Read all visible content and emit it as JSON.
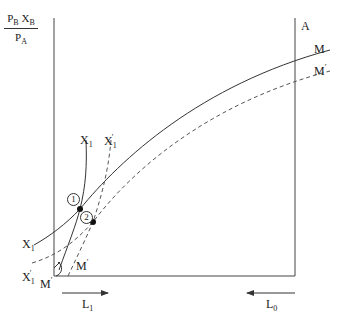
{
  "diagram": {
    "y_axis_label": {
      "numerator": [
        "P",
        "B",
        "X",
        "B"
      ],
      "denominator": [
        "P",
        "A"
      ]
    },
    "right_axis_label": "A",
    "curves": {
      "M": {
        "label": "M",
        "style": "solid"
      },
      "M_prime": {
        "label": "M",
        "prime": "′",
        "style": "dashed"
      },
      "X1": {
        "label": "X",
        "sub": "1",
        "style": "solid"
      },
      "X1_prime": {
        "label": "X",
        "sub": "1",
        "prime": "′",
        "style": "dashed"
      }
    },
    "points": [
      {
        "label": "1",
        "x": 80,
        "y": 209
      },
      {
        "label": "2",
        "x": 93,
        "y": 222
      }
    ],
    "origin_label": {
      "text": "M",
      "prime": "′"
    },
    "inner_M_prime": {
      "text": "M",
      "prime": "′"
    },
    "arrows": {
      "L1": {
        "text": "L",
        "sub": "1",
        "direction": "right"
      },
      "L0": {
        "text": "L",
        "sub": "0",
        "direction": "left"
      }
    },
    "colors": {
      "line": "#333333",
      "dashed": "#555555"
    }
  }
}
